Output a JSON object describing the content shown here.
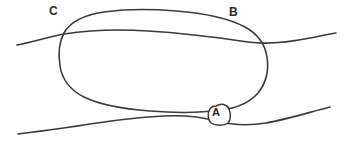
{
  "figure": {
    "background_color": "#ffffff",
    "ink_color": "#3a3a3a",
    "width": 351,
    "height": 145
  },
  "labels": {
    "a": "A",
    "b": "B",
    "c": "C"
  },
  "annotations": [
    {
      "id": "label-c",
      "text": "C",
      "x": 55,
      "y": 11,
      "style": "bold",
      "enclosed": false,
      "description": "label at upper-left where the oval outline crosses the upper wavy line"
    },
    {
      "id": "label-b",
      "text": "B",
      "x": 235,
      "y": 12,
      "style": "bold",
      "enclosed": false,
      "description": "label at upper-right on the top arc of the oval outline"
    },
    {
      "id": "label-a",
      "text": "A",
      "x": 218,
      "y": 113,
      "style": "bold",
      "enclosed": true,
      "description": "label inside a small hand-drawn blob at the bottom of the oval, touching the lower wavy line"
    }
  ],
  "shapes": {
    "upper_boundary_line": {
      "name": "upper-wavy-line",
      "type": "open-curve",
      "description": "gently undulating near-horizontal line crossing the full width, dipping slightly at center-left and rising to the right"
    },
    "lower_boundary_line": {
      "name": "lower-wavy-line",
      "type": "open-curve",
      "description": "undulating near-horizontal line along the bottom, rising from lower-left toward the right"
    },
    "closed_outline": {
      "name": "large-oval-outline",
      "type": "closed-curve",
      "description": "large irregular hand-drawn oval spanning the middle, overlapping both wavy lines"
    },
    "small_blob": {
      "name": "label-a-blob",
      "type": "closed-curve",
      "description": "small rounded hand-drawn enclosure around the letter A"
    }
  }
}
